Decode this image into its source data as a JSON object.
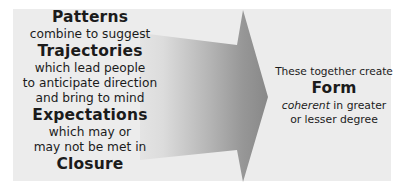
{
  "diagram": {
    "panel_color": "#ececec",
    "background_color": "#ffffff",
    "text_color": "#1b1b1b"
  },
  "arrow": {
    "name": "right-pointing-arrow",
    "direction": "right",
    "gradient_from": "#dedede",
    "gradient_to": "#8a8a8a"
  },
  "left_column": {
    "lines": [
      {
        "text": "Patterns",
        "style": "keyword"
      },
      {
        "text": "combine to suggest",
        "style": "connector"
      },
      {
        "text": "Trajectories",
        "style": "keyword"
      },
      {
        "text": "which lead people",
        "style": "connector"
      },
      {
        "text": "to anticipate direction",
        "style": "connector"
      },
      {
        "text": "and bring to mind",
        "style": "connector"
      },
      {
        "text": "Expectations",
        "style": "keyword"
      },
      {
        "text": "which may or",
        "style": "connector"
      },
      {
        "text": "may not be met in",
        "style": "connector"
      },
      {
        "text": "Closure",
        "style": "keyword"
      }
    ]
  },
  "right_column": {
    "lead": "These together create",
    "keyword": "Form",
    "tail_italic": "coherent",
    "tail_rest": " in greater",
    "tail_line2": "or lesser degree"
  }
}
